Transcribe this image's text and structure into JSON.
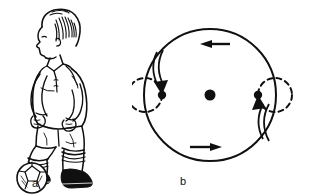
{
  "figure": {
    "background_color": "#ffffff",
    "ink_color": "#101010",
    "width": 317,
    "height": 196,
    "panels": [
      {
        "id": "a",
        "caption": "a",
        "title": "soccer player resting foot on ball",
        "elements": [
          {
            "name": "player-head",
            "label": "head"
          },
          {
            "name": "player-torso",
            "label": "jersey torso"
          },
          {
            "name": "player-arms",
            "label": "arms"
          },
          {
            "name": "player-shorts",
            "label": "shorts"
          },
          {
            "name": "player-legs",
            "label": "legs with socks"
          },
          {
            "name": "player-boots",
            "label": "boots"
          },
          {
            "name": "soccer-ball",
            "label": "soccer ball"
          }
        ]
      },
      {
        "id": "b",
        "caption": "b",
        "title": "circular path with two orbiting markers",
        "elements": [
          {
            "name": "main-circle",
            "label": "large solid circle path"
          },
          {
            "name": "center-dot",
            "label": "center point"
          },
          {
            "name": "left-dashed-circle",
            "label": "left dashed circle"
          },
          {
            "name": "right-dashed-circle",
            "label": "right dashed circle"
          },
          {
            "name": "left-marker-dot",
            "label": "left marker point"
          },
          {
            "name": "right-marker-dot",
            "label": "right marker point"
          },
          {
            "name": "top-arrow",
            "label": "top arrow pointing left"
          },
          {
            "name": "bottom-arrow",
            "label": "bottom arrow pointing right"
          },
          {
            "name": "left-curved-arrow",
            "label": "curved arrow into left marker"
          },
          {
            "name": "right-curved-arrow",
            "label": "curved arrow into right marker"
          }
        ],
        "geometry": {
          "center_x": 78,
          "center_y": 95,
          "radius": 66,
          "small_radius": 17,
          "rotation_direction": "counterclockwise"
        }
      }
    ]
  }
}
